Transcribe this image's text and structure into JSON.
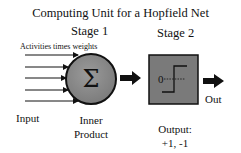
{
  "title": "Computing Unit for a Hopfield Net",
  "stages": {
    "stage1": "Stage 1",
    "stage2": "Stage 2"
  },
  "inputs": {
    "annotation": "Activities times weights",
    "label": "Input",
    "arrow_count": 5
  },
  "summation": {
    "symbol": "Σ",
    "label_line1": "Inner",
    "label_line2": "Product"
  },
  "threshold": {
    "threshold_value": "0",
    "label_line1": "Output:",
    "label_line2": "+1, -1"
  },
  "output": {
    "label": "Out"
  },
  "colors": {
    "circle_fill": "#8c8c8c",
    "box_fill": "#7a7a7a",
    "stroke": "#111111"
  }
}
